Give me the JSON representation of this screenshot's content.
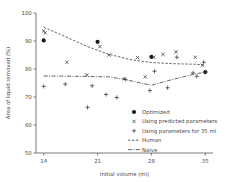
{
  "chart_data": {
    "type": "scatter",
    "title": "",
    "xlabel": "Initial volume (ml)",
    "ylabel": "Area of liquid removed (%)",
    "xlim": [
      13,
      36
    ],
    "ylim": [
      50,
      100
    ],
    "xticks": [
      14,
      21,
      28,
      35
    ],
    "yticks": [
      50,
      60,
      70,
      80,
      90,
      100
    ],
    "grid": false,
    "legend_position": "lower right",
    "series": [
      {
        "name": "Optimized",
        "marker": "filled-circle",
        "x": [
          14,
          21,
          28,
          35
        ],
        "y": [
          90.2,
          89.7,
          84.3,
          78.9
        ]
      },
      {
        "name": "Using predicted parameters",
        "marker": "x",
        "x": [
          14,
          14.2,
          17,
          19.6,
          21.3,
          22.5,
          24.5,
          26.2,
          27.2,
          28.3,
          29.5,
          31.2,
          33.7,
          34.6
        ],
        "y": [
          93.6,
          92.9,
          82.4,
          77.9,
          88.0,
          85.0,
          76.5,
          84.1,
          77.2,
          84.2,
          85.2,
          86.1,
          84.2,
          81.3
        ]
      },
      {
        "name": "Using parameters for 35 ml",
        "marker": "plus",
        "x": [
          14,
          16.8,
          19.7,
          20.3,
          22.1,
          23.5,
          24.6,
          27.8,
          28.4,
          30.1,
          31.3,
          33.4,
          33.9,
          34.8,
          35
        ],
        "y": [
          73.8,
          74.6,
          66.3,
          74.0,
          70.9,
          69.8,
          76.3,
          72.3,
          79.2,
          73.3,
          84.2,
          78.6,
          77.4,
          82.4,
          78.9
        ]
      }
    ],
    "lines": [
      {
        "name": "Human",
        "style": "dashed",
        "x": [
          14,
          16.8,
          19.6,
          22.4,
          25.2,
          28,
          30.8,
          33.6,
          35
        ],
        "y": [
          94.9,
          91.6,
          88.1,
          85.3,
          83.4,
          82.3,
          81.9,
          81.7,
          81.4
        ]
      },
      {
        "name": "Naive",
        "style": "dash-dot",
        "x": [
          14,
          18.2,
          22.4,
          24.5,
          26.6,
          28,
          30.8,
          33.6,
          35
        ],
        "y": [
          77.5,
          77.4,
          77.2,
          76.3,
          75.0,
          74.2,
          76.3,
          78.2,
          78.9
        ]
      }
    ],
    "legend_items": [
      {
        "label": "Optimized",
        "marker": "filled-circle"
      },
      {
        "label": "Using predicted parameters",
        "marker": "x"
      },
      {
        "label": "Using parameters for 35 ml",
        "marker": "plus"
      },
      {
        "label": "Human",
        "marker": "dashed-line"
      },
      {
        "label": "Naive",
        "marker": "dash-dot-line"
      }
    ],
    "colors": {
      "marker": "#3b3b3b",
      "line": "#3b3b3b",
      "axis": "#555555",
      "text": "#4a4a4a",
      "background": "#ffffff"
    }
  }
}
